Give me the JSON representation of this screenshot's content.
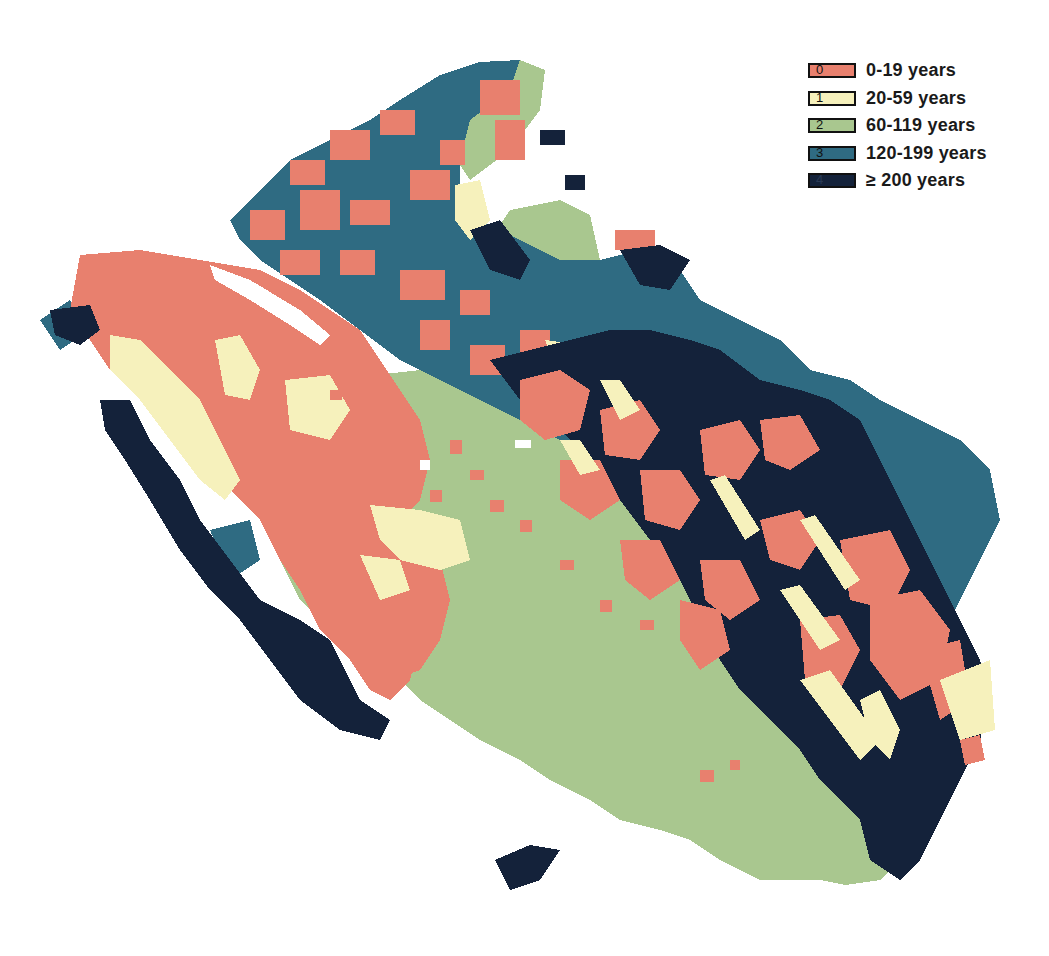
{
  "map": {
    "type": "forest-age-class-raster",
    "classes": [
      {
        "code": "0",
        "label": "0-19 years",
        "color": "#E8806E"
      },
      {
        "code": "1",
        "label": "20-59 years",
        "color": "#F6F1BC"
      },
      {
        "code": "2",
        "label": "60-119 years",
        "color": "#A9C78F"
      },
      {
        "code": "3",
        "label": "120-199 years",
        "color": "#2F6B82"
      },
      {
        "code": "4",
        "label": "≥ 200 years",
        "color": "#14223A"
      }
    ]
  },
  "legend": {
    "items": [
      {
        "code": "0",
        "label": "0-19 years",
        "color": "#E8806E"
      },
      {
        "code": "1",
        "label": "20-59 years",
        "color": "#F6F1BC"
      },
      {
        "code": "2",
        "label": "60-119 years",
        "color": "#A9C78F"
      },
      {
        "code": "3",
        "label": "120-199 years",
        "color": "#2F6B82"
      },
      {
        "code": "4",
        "label": "≥ 200 years",
        "color": "#14223A"
      }
    ]
  }
}
